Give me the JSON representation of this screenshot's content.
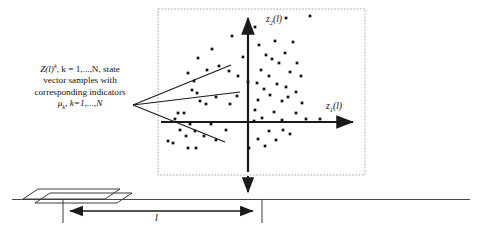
{
  "figure": {
    "background": "#ffffff",
    "stroke_color": "#1a1a1a",
    "point_color": "#111111",
    "dashed_border_color": "#9a9a9a"
  },
  "annotation": {
    "line1_a": "Z(l)",
    "line1_sup": "k",
    "line1_b": ", k = 1,...,N, state",
    "line2": "vector samples with",
    "line3": "corresponding indicators",
    "line4_mu": "μ",
    "line4_sub": "k",
    "line4_b": ", k=1,...,N"
  },
  "axes": {
    "vertical_label_main": "z",
    "vertical_label_sub": "2",
    "vertical_label_tail": "(l)",
    "horizontal_label_main": "z",
    "horizontal_label_sub": "1",
    "horizontal_label_tail": "(l)"
  },
  "dimension": {
    "label": "l"
  },
  "chart_data": {
    "type": "scatter",
    "title": "",
    "xlabel": "z1(l)",
    "ylabel": "z2(l)",
    "grid": false,
    "legend": "none",
    "origin_px": [
      248,
      122
    ],
    "xlim_px": [
      158,
      365
    ],
    "ylim_px": [
      9,
      175
    ],
    "points": [
      [
        232,
        36
      ],
      [
        212,
        49
      ],
      [
        243,
        57
      ],
      [
        198,
        58
      ],
      [
        219,
        66
      ],
      [
        207,
        70
      ],
      [
        229,
        71
      ],
      [
        188,
        73
      ],
      [
        238,
        76
      ],
      [
        194,
        81
      ],
      [
        248,
        82
      ],
      [
        192,
        90
      ],
      [
        197,
        93
      ],
      [
        237,
        96
      ],
      [
        216,
        97
      ],
      [
        200,
        101
      ],
      [
        206,
        104
      ],
      [
        230,
        104
      ],
      [
        178,
        113
      ],
      [
        184,
        113
      ],
      [
        175,
        119
      ],
      [
        190,
        124
      ],
      [
        211,
        124
      ],
      [
        180,
        130
      ],
      [
        195,
        131
      ],
      [
        186,
        136
      ],
      [
        168,
        141
      ],
      [
        216,
        140
      ],
      [
        173,
        143
      ],
      [
        204,
        136
      ],
      [
        188,
        148
      ],
      [
        196,
        148
      ],
      [
        226,
        130
      ],
      [
        259,
        45
      ],
      [
        275,
        41
      ],
      [
        293,
        42
      ],
      [
        266,
        55
      ],
      [
        285,
        53
      ],
      [
        272,
        59
      ],
      [
        279,
        63
      ],
      [
        297,
        63
      ],
      [
        261,
        70
      ],
      [
        290,
        72
      ],
      [
        269,
        76
      ],
      [
        301,
        76
      ],
      [
        257,
        83
      ],
      [
        277,
        84
      ],
      [
        286,
        87
      ],
      [
        264,
        89
      ],
      [
        296,
        92
      ],
      [
        270,
        95
      ],
      [
        258,
        100
      ],
      [
        282,
        101
      ],
      [
        302,
        103
      ],
      [
        288,
        97
      ],
      [
        255,
        110
      ],
      [
        274,
        112
      ],
      [
        296,
        113
      ],
      [
        262,
        118
      ],
      [
        282,
        120
      ],
      [
        306,
        119
      ],
      [
        254,
        121
      ],
      [
        320,
        119
      ],
      [
        269,
        131
      ],
      [
        283,
        130
      ],
      [
        290,
        134
      ],
      [
        258,
        139
      ],
      [
        276,
        140
      ],
      [
        249,
        148
      ],
      [
        265,
        146
      ],
      [
        255,
        27
      ],
      [
        286,
        18
      ],
      [
        310,
        16
      ]
    ]
  }
}
